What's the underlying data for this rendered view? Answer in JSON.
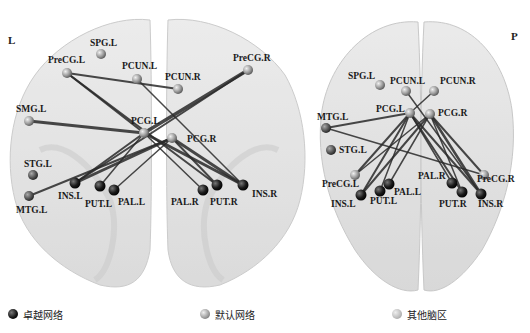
{
  "panels": [
    {
      "id": "coronal",
      "side_label": "L",
      "nodes": [
        {
          "name": "SPG.L",
          "x": 101,
          "y": 54,
          "group": "default",
          "lx": 90,
          "ly": 46
        },
        {
          "name": "PreCG.L",
          "x": 67,
          "y": 73,
          "group": "default",
          "lx": 48,
          "ly": 63
        },
        {
          "name": "PCUN.L",
          "x": 137,
          "y": 79,
          "group": "default",
          "lx": 122,
          "ly": 69
        },
        {
          "name": "PCUN.R",
          "x": 178,
          "y": 89,
          "group": "default",
          "lx": 165,
          "ly": 80
        },
        {
          "name": "PreCG.R",
          "x": 248,
          "y": 70,
          "group": "default",
          "lx": 233,
          "ly": 61
        },
        {
          "name": "SMG.L",
          "x": 29,
          "y": 121,
          "group": "default",
          "lx": 16,
          "ly": 112
        },
        {
          "name": "PCG.L",
          "x": 144,
          "y": 133,
          "group": "default",
          "lx": 131,
          "ly": 124
        },
        {
          "name": "PCG.R",
          "x": 172,
          "y": 138,
          "group": "default",
          "lx": 187,
          "ly": 142
        },
        {
          "name": "STG.L",
          "x": 33,
          "y": 175,
          "group": "other",
          "lx": 24,
          "ly": 167
        },
        {
          "name": "MTG.L",
          "x": 29,
          "y": 196,
          "group": "other",
          "lx": 16,
          "ly": 213
        },
        {
          "name": "INS.L",
          "x": 75,
          "y": 183,
          "group": "salience",
          "lx": 58,
          "ly": 199
        },
        {
          "name": "PUT.L",
          "x": 100,
          "y": 186,
          "group": "salience",
          "lx": 85,
          "ly": 207
        },
        {
          "name": "PAL.L",
          "x": 114,
          "y": 190,
          "group": "salience",
          "lx": 118,
          "ly": 205
        },
        {
          "name": "PAL.R",
          "x": 203,
          "y": 190,
          "group": "salience",
          "lx": 171,
          "ly": 205
        },
        {
          "name": "PUT.R",
          "x": 217,
          "y": 185,
          "group": "salience",
          "lx": 210,
          "ly": 205
        },
        {
          "name": "INS.R",
          "x": 243,
          "y": 185,
          "group": "salience",
          "lx": 252,
          "ly": 197
        }
      ],
      "edges": [
        [
          "PreCG.L",
          "PCUN.R",
          2
        ],
        [
          "PreCG.L",
          "PCG.L",
          2
        ],
        [
          "PreCG.L",
          "PUT.R",
          2
        ],
        [
          "PreCG.R",
          "PCG.L",
          3.5
        ],
        [
          "PreCG.R",
          "INS.L",
          2
        ],
        [
          "PCUN.L",
          "INS.R",
          1.5
        ],
        [
          "SMG.L",
          "PCG.L",
          3
        ],
        [
          "PCG.L",
          "INS.L",
          2
        ],
        [
          "PCG.L",
          "PUT.L",
          1.5
        ],
        [
          "PCG.L",
          "PAL.R",
          1.5
        ],
        [
          "PCG.L",
          "INS.R",
          3
        ],
        [
          "PCG.R",
          "INS.L",
          3
        ],
        [
          "PCG.R",
          "MTG.L",
          2
        ],
        [
          "PCG.R",
          "PAL.L",
          1.5
        ],
        [
          "PCG.R",
          "PUT.R",
          2
        ],
        [
          "PCG.R",
          "INS.R",
          3
        ]
      ]
    },
    {
      "id": "axial",
      "side_label": "P",
      "nodes": [
        {
          "name": "SPG.L",
          "x": 380,
          "y": 85,
          "group": "default",
          "lx": 348,
          "ly": 79
        },
        {
          "name": "PCUN.L",
          "x": 406,
          "y": 91,
          "group": "default",
          "lx": 390,
          "ly": 84
        },
        {
          "name": "PCUN.R",
          "x": 434,
          "y": 91,
          "group": "default",
          "lx": 440,
          "ly": 84
        },
        {
          "name": "PCG.L",
          "x": 410,
          "y": 113,
          "group": "default",
          "lx": 376,
          "ly": 112
        },
        {
          "name": "PCG.R",
          "x": 430,
          "y": 114,
          "group": "default",
          "lx": 438,
          "ly": 116
        },
        {
          "name": "MTG.L",
          "x": 326,
          "y": 128,
          "group": "other",
          "lx": 317,
          "ly": 120
        },
        {
          "name": "STG.L",
          "x": 331,
          "y": 150,
          "group": "other",
          "lx": 339,
          "ly": 153
        },
        {
          "name": "PreCG.L",
          "x": 355,
          "y": 175,
          "group": "default",
          "lx": 322,
          "ly": 187
        },
        {
          "name": "PAL.L",
          "x": 389,
          "y": 184,
          "group": "salience",
          "lx": 394,
          "ly": 195
        },
        {
          "name": "PUT.L",
          "x": 380,
          "y": 191,
          "group": "salience",
          "lx": 370,
          "ly": 204
        },
        {
          "name": "INS.L",
          "x": 361,
          "y": 195,
          "group": "salience",
          "lx": 331,
          "ly": 207
        },
        {
          "name": "PAL.R",
          "x": 452,
          "y": 183,
          "group": "salience",
          "lx": 418,
          "ly": 179
        },
        {
          "name": "PUT.R",
          "x": 462,
          "y": 192,
          "group": "salience",
          "lx": 439,
          "ly": 207
        },
        {
          "name": "INS.R",
          "x": 481,
          "y": 194,
          "group": "salience",
          "lx": 478,
          "ly": 207
        },
        {
          "name": "PreCG.R",
          "x": 484,
          "y": 175,
          "group": "default",
          "lx": 477,
          "ly": 182
        }
      ],
      "edges": [
        [
          "MTG.L",
          "PCG.L",
          2
        ],
        [
          "MTG.L",
          "PreCG.R",
          1.5
        ],
        [
          "PCUN.L",
          "INS.R",
          1.5
        ],
        [
          "PCUN.R",
          "PCG.L",
          1.5
        ],
        [
          "PCG.L",
          "PreCG.L",
          2
        ],
        [
          "PCG.L",
          "INS.L",
          2
        ],
        [
          "PCG.L",
          "PUT.L",
          1.5
        ],
        [
          "PCG.L",
          "PAL.R",
          1.5
        ],
        [
          "PCG.L",
          "PUT.R",
          2
        ],
        [
          "PCG.L",
          "INS.R",
          2
        ],
        [
          "PCG.R",
          "INS.L",
          2
        ],
        [
          "PCG.R",
          "PreCG.L",
          1.5
        ],
        [
          "PCG.R",
          "PAL.L",
          1.5
        ],
        [
          "PCG.R",
          "INS.R",
          2.5
        ],
        [
          "PCG.R",
          "PreCG.R",
          2
        ],
        [
          "PCG.R",
          "PUT.R",
          1.5
        ]
      ]
    }
  ],
  "legend": [
    {
      "label": "卓越网络",
      "group": "salience",
      "color": "#1a1a1a"
    },
    {
      "label": "默认网络",
      "group": "default",
      "color": "#8a8a8a"
    },
    {
      "label": "其他脑区",
      "group": "other",
      "color": "#c8c8c8"
    }
  ],
  "colors": {
    "salience": "#1c1c1c",
    "default": "#9a9a9a",
    "other": "#6a6a6a",
    "edge": "#2a2a2a",
    "brain": "#d4d4d4"
  }
}
